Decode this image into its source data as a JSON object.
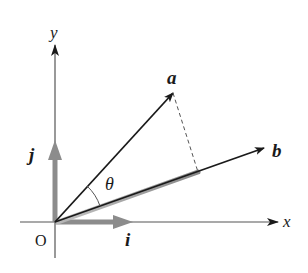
{
  "diagram": {
    "origin_label": "O",
    "axes": {
      "x_label": "x",
      "y_label": "y"
    },
    "vectors": {
      "a_label": "a",
      "b_label": "b",
      "i_label": "i",
      "j_label": "j"
    },
    "angle_label": "θ",
    "colors": {
      "ink": "#1a1a1a",
      "axis": "#555555",
      "unit_vector": "#8c8c8c",
      "projection_shadow": "#9a9a9a",
      "dashed": "#555555",
      "background": "#ffffff"
    }
  }
}
